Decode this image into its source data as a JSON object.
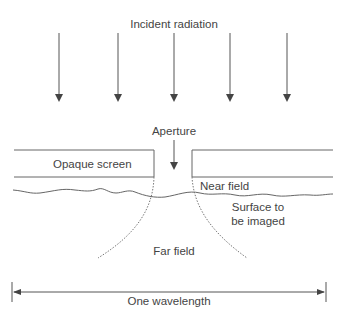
{
  "diagram": {
    "labels": {
      "incident_radiation": "Incident radiation",
      "aperture": "Aperture",
      "opaque_screen": "Opaque screen",
      "near_field": "Near field",
      "surface_line1": "Surface to",
      "surface_line2": "be imaged",
      "far_field": "Far field",
      "one_wavelength": "One wavelength"
    },
    "incident_arrows": {
      "count": 5,
      "x_positions": [
        59,
        118,
        174,
        230,
        287
      ]
    },
    "colors": {
      "line": "#555555",
      "text": "#444444",
      "background": "#ffffff"
    }
  }
}
